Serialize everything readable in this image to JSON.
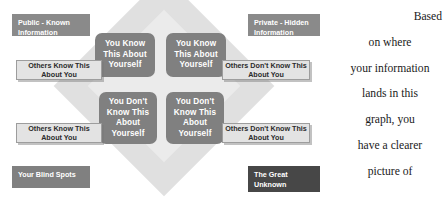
{
  "figure": {
    "name": "johari-window-diagram",
    "corner_labels": {
      "top_left": "Public - Known Information",
      "top_right": "Private - Hidden Information",
      "bottom_left": "Your Blind Spots",
      "bottom_right": "The Great Unknown"
    },
    "quadrants": {
      "top_left": "You Know This About Yourself",
      "top_right": "You Know This About Yourself",
      "bottom_left": "You Don't Know This About Yourself",
      "bottom_right": "You Don't Know This About Yourself"
    },
    "side_labels": {
      "top_left": "Others Know This About You",
      "top_right": "Others Don't Know This About You",
      "bottom_left": "Others Know This About You",
      "bottom_right": "Others Don't Know This About You"
    },
    "colors": {
      "quadrant_fill": "#808080",
      "quadrant_text": "#ffffff",
      "side_label_fill": "#e3e3e3",
      "side_label_border": "#9d9d9d",
      "corner_label_fill": "#8a8a8a",
      "corner_dark_fill": "#474747",
      "diamond_outer": "#e0e0e0",
      "diamond_inner": "#ebebeb",
      "page_background": "#ffffff",
      "body_text": "#1a1a1a"
    }
  },
  "body_copy": {
    "full_text": "Based on where your information lands in this graph, you have a clearer picture of",
    "lines": [
      "Based",
      "on where",
      "your information",
      "lands in this",
      "graph, you",
      "have a clearer",
      "picture of"
    ]
  }
}
